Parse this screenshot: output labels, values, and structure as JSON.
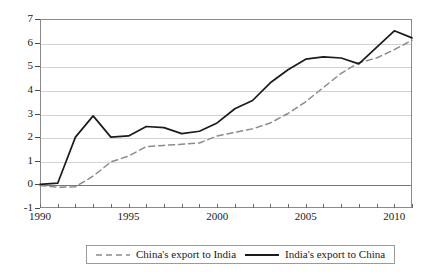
{
  "chart_data": {
    "type": "line",
    "title": "",
    "subtitle": "",
    "xlabel": "",
    "ylabel": "",
    "xlim": [
      1990,
      2011
    ],
    "ylim": [
      -1,
      7
    ],
    "grid": true,
    "legend_position": "bottom",
    "y_ticks": [
      7,
      6,
      5,
      4,
      3,
      2,
      1,
      0,
      -1
    ],
    "y_tick_labels": [
      "7",
      "6",
      "5",
      "4",
      "3",
      "2",
      "1",
      "0",
      "-1"
    ],
    "x_ticks": [
      1990,
      1991,
      1992,
      1993,
      1994,
      1995,
      1996,
      1997,
      1998,
      1999,
      2000,
      2001,
      2002,
      2003,
      2004,
      2005,
      2006,
      2007,
      2008,
      2009,
      2010,
      2011
    ],
    "x_tick_labels_shown": [
      "1990",
      "1995",
      "2000",
      "2005",
      "2010"
    ],
    "x_labeled_years": [
      1990,
      1995,
      2000,
      2005,
      2010
    ],
    "x": [
      1990,
      1991,
      1992,
      1993,
      1994,
      1995,
      1996,
      1997,
      1998,
      1999,
      2000,
      2001,
      2002,
      2003,
      2004,
      2005,
      2006,
      2007,
      2008,
      2009,
      2010,
      2011
    ],
    "series": [
      {
        "name": "China's export to India",
        "style": "dashed",
        "color": "#8b8b8b",
        "values": [
          -0.05,
          -0.12,
          -0.1,
          0.35,
          0.95,
          1.2,
          1.6,
          1.65,
          1.7,
          1.75,
          2.05,
          2.2,
          2.35,
          2.6,
          3.0,
          3.5,
          4.1,
          4.7,
          5.15,
          5.35,
          5.7,
          6.1
        ]
      },
      {
        "name": "India's export to China",
        "style": "solid",
        "color": "#1b1b1b",
        "values": [
          0.0,
          0.05,
          2.0,
          2.9,
          2.0,
          2.05,
          2.45,
          2.4,
          2.15,
          2.25,
          2.6,
          3.2,
          3.55,
          4.3,
          4.85,
          5.3,
          5.4,
          5.35,
          5.1,
          5.8,
          6.5,
          6.2
        ]
      }
    ],
    "legend": [
      {
        "label": "China's export to India",
        "style": "dashed",
        "color": "#8b8b8b"
      },
      {
        "label": "India's export to China",
        "style": "solid",
        "color": "#1b1b1b"
      }
    ]
  }
}
